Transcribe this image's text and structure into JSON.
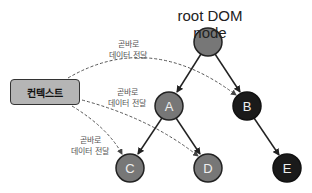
{
  "title": "root DOM node",
  "context": {
    "label": "컨텍스트"
  },
  "labels": [
    {
      "line1": "곧바로",
      "line2": "데이터 전달"
    },
    {
      "line1": "곧바로",
      "line2": "데이터 전달"
    },
    {
      "line1": "곧바로",
      "line2": "데이터 전달"
    }
  ],
  "nodes": [
    {
      "id": "root",
      "label": "",
      "fill": "#777777"
    },
    {
      "id": "A",
      "label": "A",
      "fill": "#777777"
    },
    {
      "id": "B",
      "label": "B",
      "fill": "#1a1a1a"
    },
    {
      "id": "C",
      "label": "C",
      "fill": "#777777"
    },
    {
      "id": "D",
      "label": "D",
      "fill": "#777777"
    },
    {
      "id": "E",
      "label": "E",
      "fill": "#1a1a1a"
    }
  ],
  "edges": [
    {
      "from": "root",
      "to": "A"
    },
    {
      "from": "root",
      "to": "B"
    },
    {
      "from": "A",
      "to": "C"
    },
    {
      "from": "A",
      "to": "D"
    },
    {
      "from": "B",
      "to": "E"
    }
  ],
  "context_edges": [
    {
      "from": "컨텍스트",
      "to": "B",
      "style": "dashed"
    },
    {
      "from": "컨텍스트",
      "to": "D",
      "style": "dashed"
    },
    {
      "from": "컨텍스트",
      "to": "C",
      "style": "dashed"
    }
  ]
}
